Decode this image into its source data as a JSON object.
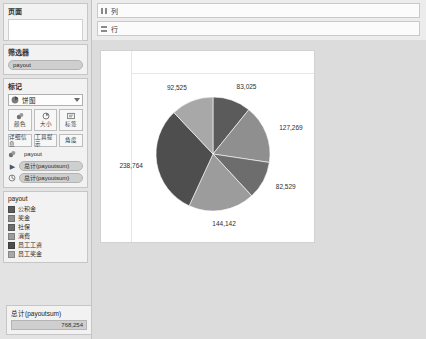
{
  "sidebar": {
    "pages": {
      "title": "页面",
      "items": []
    },
    "filters": {
      "title": "筛选器",
      "pills": [
        {
          "label": "payout",
          "icon": "filter-pill"
        }
      ]
    },
    "marks": {
      "title": "标记",
      "mark_type": "饼图",
      "mark_type_icon": "pie-icon",
      "dropdown_icon": "chevron-down-icon",
      "buttons": [
        {
          "label": "颜色",
          "icon": "color-icon"
        },
        {
          "label": "大小",
          "icon": "size-icon"
        },
        {
          "label": "标签",
          "icon": "label-icon"
        },
        {
          "label": "详细信息",
          "icon": "detail-icon"
        },
        {
          "label": "工具提示",
          "icon": "tooltip-icon"
        },
        {
          "label": "角度",
          "icon": "angle-icon"
        }
      ],
      "pills": [
        {
          "label": "payout",
          "hint_icon": "color-icon",
          "boxed": false
        },
        {
          "label": "总计(payoutsum)",
          "hint_icon": "label-icon",
          "boxed": true
        },
        {
          "label": "总计(payoutsum)",
          "hint_icon": "angle-icon",
          "boxed": true
        }
      ]
    },
    "legend": {
      "title": "payout",
      "items": [
        {
          "label": "公积金",
          "color": "#5b5b5b"
        },
        {
          "label": "奖金",
          "color": "#8f8f8f"
        },
        {
          "label": "社保",
          "color": "#6d6d6d"
        },
        {
          "label": "消费",
          "color": "#9c9c9c"
        },
        {
          "label": "员工工资",
          "color": "#4e4e4e"
        },
        {
          "label": "员工奖金",
          "color": "#a8a8a8"
        }
      ]
    },
    "total": {
      "label": "总计(payoutsum)",
      "value": "768,254"
    }
  },
  "shelves": [
    {
      "name": "columns",
      "label": "列",
      "icon": "columns-icon",
      "pills": []
    },
    {
      "name": "rows",
      "label": "行",
      "icon": "rows-icon",
      "pills": []
    }
  ],
  "chart_data": {
    "type": "pie",
    "title": "",
    "legend_position": "left-sidebar",
    "legend_title": "payout",
    "categories": [
      "公积金",
      "奖金",
      "社保",
      "消费",
      "员工工资",
      "员工奖金"
    ],
    "values": [
      83025,
      127269,
      82529,
      144142,
      238764,
      92525
    ],
    "labels": [
      "83,025",
      "127,269",
      "82,529",
      "144,142",
      "238,764",
      "92,525"
    ],
    "colors": [
      "#5b5b5b",
      "#8f8f8f",
      "#6d6d6d",
      "#9c9c9c",
      "#4e4e4e",
      "#a8a8a8"
    ],
    "total": 768254,
    "total_label": "768,254"
  }
}
